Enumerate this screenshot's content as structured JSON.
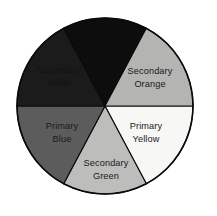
{
  "figure": {
    "name": "color-wheel",
    "background_color": "#ffffff",
    "outline_color": "#0a0a0a",
    "center_x": 105,
    "center_y": 106,
    "radius": 88,
    "segment_count": 6
  },
  "segments": [
    {
      "id": "primary-yellow",
      "label_line1": "Primary",
      "label_line2": "Yellow",
      "category": "Primary",
      "hue": "Yellow",
      "fill": "#f7f7f5",
      "text_color": "#1a1a1a",
      "text_visible": true,
      "start_angle": 0,
      "end_angle": 62,
      "label_x": 146,
      "label_y": 133
    },
    {
      "id": "secondary-green",
      "label_line1": "Secondary",
      "label_line2": "Green",
      "category": "Secondary",
      "hue": "Green",
      "fill": "#bdbdbb",
      "text_color": "#1a1a1a",
      "text_visible": true,
      "start_angle": 62,
      "end_angle": 118,
      "label_x": 106,
      "label_y": 170
    },
    {
      "id": "primary-blue",
      "label_line1": "Primary",
      "label_line2": "Blue",
      "category": "Primary",
      "hue": "Blue",
      "fill": "#5c5c5c",
      "text_color": "#1a1a1a",
      "text_visible": true,
      "start_angle": 118,
      "end_angle": 180,
      "label_x": 62,
      "label_y": 133
    },
    {
      "id": "secondary-violet",
      "label_line1": "Secondary",
      "label_line2": "Violet",
      "category": "Secondary",
      "hue": "Violet",
      "fill": "#1b1b1b",
      "text_color": "#121212",
      "text_visible": false,
      "start_angle": 180,
      "end_angle": 242,
      "label_x": 59,
      "label_y": 77
    },
    {
      "id": "primary-red",
      "label_line1": "Primary",
      "label_line2": "Red",
      "category": "Primary",
      "hue": "Red",
      "fill": "#0d0d0d",
      "text_color": "#0e0e0e",
      "text_visible": false,
      "start_angle": 242,
      "end_angle": 298,
      "label_x": 107,
      "label_y": 48
    },
    {
      "id": "secondary-orange",
      "label_line1": "Secondary",
      "label_line2": "Orange",
      "category": "Secondary",
      "hue": "Orange",
      "fill": "#b4b4b2",
      "text_color": "#1a1a1a",
      "text_visible": true,
      "start_angle": 298,
      "end_angle": 360,
      "label_x": 150,
      "label_y": 78
    }
  ]
}
